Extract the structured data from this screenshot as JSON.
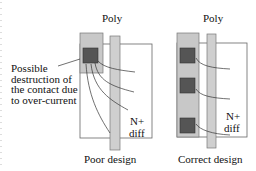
{
  "diagram": {
    "left_panel": {
      "poly_label": "Poly",
      "diff_label_line1": "N+",
      "diff_label_line2": "diff",
      "caption": "Poor design",
      "contacts": 1,
      "annotation": [
        "Possible",
        "destruction of",
        "the contact due",
        "to over-current"
      ]
    },
    "right_panel": {
      "poly_label": "Poly",
      "diff_label_line1": "N+",
      "diff_label_line2": "diff",
      "caption": "Correct design",
      "contacts": 3
    },
    "colors": {
      "metal": "#c8c8c8",
      "contact": "#555555",
      "poly": "#cfcfcf",
      "outline": "#666666"
    }
  }
}
